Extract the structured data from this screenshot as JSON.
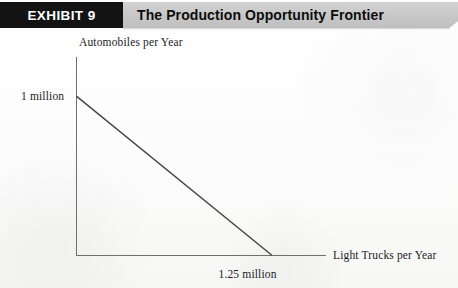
{
  "header": {
    "exhibit_tag": "EXHIBIT 9",
    "title": "The Production Opportunity Frontier",
    "tag_background": "#131313",
    "tag_text_color": "#ffffff",
    "band_background": "#c9c9c9",
    "title_text_color": "#0d0d0d"
  },
  "chart_data": {
    "type": "line",
    "title": "The Production Opportunity Frontier",
    "xlabel": "Light Trucks per Year",
    "ylabel": "Automobiles per Year",
    "x_tick_labels": [
      "1.25 million"
    ],
    "y_tick_labels": [
      "1 million"
    ],
    "x_tick_values": [
      1.25
    ],
    "y_tick_values": [
      1.0
    ],
    "xlim": [
      0,
      1.6
    ],
    "ylim": [
      0,
      1.25
    ],
    "grid": false,
    "legend": null,
    "line_color": "#4a4a4a",
    "axis_color": "#6f6f6f",
    "series": [
      {
        "name": "Production Opportunity Frontier",
        "x": [
          0,
          1.25
        ],
        "y": [
          1.0,
          0
        ]
      }
    ],
    "annotations": []
  }
}
